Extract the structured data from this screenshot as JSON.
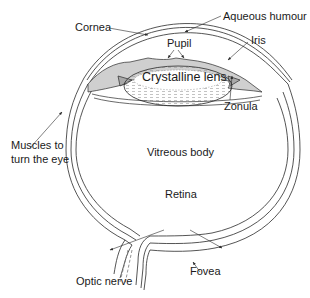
{
  "diagram": {
    "labels": {
      "cornea": "Cornea",
      "aqueous_humour": "Aqueous humour",
      "pupil": "Pupil",
      "iris": "Iris",
      "crystalline_lens": "Crystalline lens",
      "zonula": "Zonula",
      "muscles_line1": "Muscles to",
      "muscles_line2": "turn the eye",
      "vitreous_body": "Vitreous body",
      "retina": "Retina",
      "fovea": "Fovea",
      "optic_nerve": "Optic nerve"
    },
    "colors": {
      "line": "#2a2a2a",
      "iris_fill": "#cfcfcf",
      "lens_hatch": "#9a9a9a",
      "background": "#ffffff"
    }
  }
}
